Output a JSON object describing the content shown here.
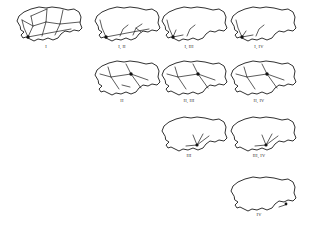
{
  "figure": {
    "title": "",
    "background_color": "#ffffff",
    "stroke_color": "#1a1a1a",
    "node_color": "#111111",
    "panel_count": 10,
    "rows": [
      4,
      3,
      2,
      1
    ]
  },
  "panels": [
    {
      "id": "panel-1",
      "label": "I",
      "row": 1,
      "col": 1,
      "x": 8,
      "y": 4,
      "width": 78,
      "height": 42,
      "label_x": 46,
      "label_y": 44,
      "node_count": 1,
      "edge_count": 9
    },
    {
      "id": "panel-2",
      "label": "I, II",
      "row": 1,
      "col": 2,
      "x": 86,
      "y": 4,
      "width": 78,
      "height": 42,
      "label_x": 122,
      "label_y": 44,
      "node_count": 1,
      "edge_count": 5
    },
    {
      "id": "panel-3",
      "label": "I, III",
      "row": 1,
      "col": 3,
      "x": 153,
      "y": 4,
      "width": 78,
      "height": 42,
      "label_x": 189,
      "label_y": 44,
      "node_count": 1,
      "edge_count": 4
    },
    {
      "id": "panel-4",
      "label": "I, IV",
      "row": 1,
      "col": 4,
      "x": 222,
      "y": 4,
      "width": 80,
      "height": 42,
      "label_x": 259,
      "label_y": 44,
      "node_count": 1,
      "edge_count": 4
    },
    {
      "id": "panel-5",
      "label": "II",
      "row": 2,
      "col": 2,
      "x": 86,
      "y": 58,
      "width": 78,
      "height": 42,
      "label_x": 122,
      "label_y": 98,
      "node_count": 1,
      "edge_count": 6
    },
    {
      "id": "panel-6",
      "label": "II, III",
      "row": 2,
      "col": 3,
      "x": 153,
      "y": 58,
      "width": 78,
      "height": 42,
      "label_x": 189,
      "label_y": 98,
      "node_count": 1,
      "edge_count": 5
    },
    {
      "id": "panel-7",
      "label": "II, IV",
      "row": 2,
      "col": 4,
      "x": 222,
      "y": 58,
      "width": 80,
      "height": 42,
      "label_x": 259,
      "label_y": 98,
      "node_count": 1,
      "edge_count": 5
    },
    {
      "id": "panel-8",
      "label": "III",
      "row": 3,
      "col": 3,
      "x": 153,
      "y": 114,
      "width": 78,
      "height": 42,
      "label_x": 189,
      "label_y": 153,
      "node_count": 1,
      "edge_count": 4
    },
    {
      "id": "panel-9",
      "label": "III, IV",
      "row": 3,
      "col": 4,
      "x": 222,
      "y": 114,
      "width": 80,
      "height": 42,
      "label_x": 259,
      "label_y": 153,
      "node_count": 1,
      "edge_count": 4
    },
    {
      "id": "panel-10",
      "label": "IV",
      "row": 4,
      "col": 4,
      "x": 222,
      "y": 174,
      "width": 80,
      "height": 42,
      "label_x": 259,
      "label_y": 212,
      "node_count": 1,
      "edge_count": 0
    }
  ]
}
